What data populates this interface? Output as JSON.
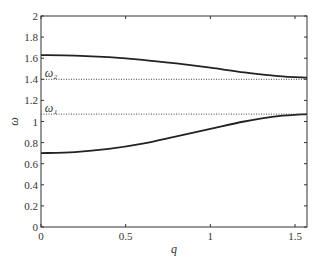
{
  "chart_data": {
    "type": "line",
    "title": "",
    "xlabel": "q",
    "ylabel": "ω",
    "xlim": [
      0,
      1.5708
    ],
    "ylim": [
      0,
      2
    ],
    "x_ticks": [
      "0",
      "0.5",
      "1",
      "1.5"
    ],
    "y_ticks": [
      "0",
      "0.2",
      "0.4",
      "0.6",
      "0.8",
      "1",
      "1.2",
      "1.4",
      "1.6",
      "1.8",
      "2"
    ],
    "grid": false,
    "x": [
      0,
      0.2,
      0.4,
      0.6,
      0.8,
      1.0,
      1.2,
      1.4,
      1.5708
    ],
    "series": [
      {
        "name": "upper branch",
        "style": "solid",
        "values": [
          1.63,
          1.625,
          1.61,
          1.585,
          1.55,
          1.51,
          1.465,
          1.43,
          1.415
        ]
      },
      {
        "name": "lower branch",
        "style": "solid",
        "values": [
          0.7,
          0.71,
          0.74,
          0.79,
          0.86,
          0.93,
          1.0,
          1.05,
          1.07
        ]
      },
      {
        "name": "ω2",
        "style": "dotted",
        "values": [
          1.4,
          1.4,
          1.4,
          1.4,
          1.4,
          1.4,
          1.4,
          1.4,
          1.4
        ]
      },
      {
        "name": "ω1",
        "style": "dotted",
        "values": [
          1.07,
          1.07,
          1.07,
          1.07,
          1.07,
          1.07,
          1.07,
          1.07,
          1.07
        ]
      }
    ],
    "annotations": [
      {
        "text": "ω₂",
        "x": 0.01,
        "y": 1.44
      },
      {
        "text": "ω₁",
        "x": 0.01,
        "y": 1.11
      }
    ]
  }
}
